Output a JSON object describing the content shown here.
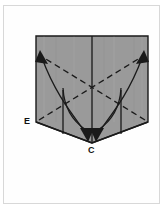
{
  "figure": {
    "frame": {
      "border_color": "#d8d8d8",
      "background": "#fefefe"
    },
    "paper": {
      "fill_color": "#9a9a9a",
      "edge_color": "#1a1a1a",
      "shape_name": "pentagon-flap-outline"
    },
    "labels": [
      {
        "id": "E",
        "text": "E",
        "x": 24,
        "y": 117
      },
      {
        "id": "C",
        "text": "C",
        "x": 88,
        "y": 146
      }
    ],
    "lines": {
      "solid_color": "#1a1a1a",
      "dashed_color": "#1a1a1a",
      "dash_pattern": "6 4"
    },
    "arrows": {
      "count": 4,
      "description": "two curved arrows sweep outward-up to the top corners and two curved arrows sweep down to point C"
    }
  }
}
